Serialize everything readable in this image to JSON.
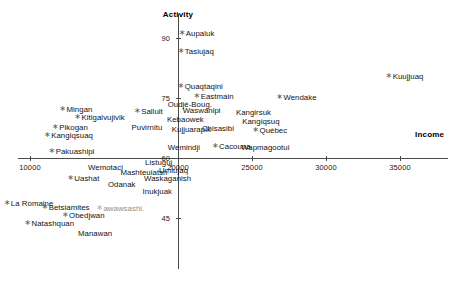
{
  "chart_data": {
    "type": "scatter",
    "title": "",
    "xlabel": "Income",
    "ylabel": "Activity",
    "xlim": [
      8200,
      36800
    ],
    "ylim": [
      40,
      93
    ],
    "xticks": [
      10000,
      20000,
      25000,
      30000,
      35000
    ],
    "yticks": [
      90,
      75,
      60,
      45
    ],
    "grid": false,
    "legend": null,
    "marker": "asterisk",
    "axes_style": "crossed-at-origin",
    "points": [
      {
        "label": "Aupaluk",
        "x": 21250,
        "y": 91.0
      },
      {
        "label": "Tasiujaq",
        "x": 21200,
        "y": 86.5
      },
      {
        "label": "Kuujjuaq",
        "x": 35300,
        "y": 80.2
      },
      {
        "label": "Quaqtaqini",
        "x": 21500,
        "y": 77.8
      },
      {
        "label": "Eastmain",
        "x": 22400,
        "y": 75.2
      },
      {
        "label": "Wendake",
        "x": 28000,
        "y": 74.9
      },
      {
        "label": "Oudjé-Boug.",
        "x": 20800,
        "y": 73.2,
        "nomarker": true
      },
      {
        "label": "Mingan",
        "x": 13100,
        "y": 72.0
      },
      {
        "label": "Waswanipi",
        "x": 21600,
        "y": 71.7,
        "nomarker": true
      },
      {
        "label": "Salluit",
        "x": 18000,
        "y": 71.5
      },
      {
        "label": "Kangirsuk",
        "x": 25100,
        "y": 71.3,
        "nomarker": true
      },
      {
        "label": "Kitigalvujivik",
        "x": 14700,
        "y": 69.9
      },
      {
        "label": "Kebaowek",
        "x": 20500,
        "y": 69.4,
        "nomarker": true
      },
      {
        "label": "Kangiqsuq",
        "x": 25600,
        "y": 68.9,
        "nomarker": true
      },
      {
        "label": "Pikogan",
        "x": 12700,
        "y": 67.6
      },
      {
        "label": "Puvirnitu",
        "x": 17900,
        "y": 67.5,
        "nomarker": true
      },
      {
        "label": "Kujjuarapik",
        "x": 20900,
        "y": 67.1,
        "nomarker": true
      },
      {
        "label": "Chisasibi",
        "x": 22700,
        "y": 67.2,
        "nomarker": true
      },
      {
        "label": "Québec",
        "x": 26200,
        "y": 66.8
      },
      {
        "label": "Kangiqsuaq",
        "x": 12600,
        "y": 65.6
      },
      {
        "label": "Wemindji",
        "x": 20400,
        "y": 62.6,
        "nomarker": true
      },
      {
        "label": "Cacouna",
        "x": 23600,
        "y": 62.7
      },
      {
        "label": "Wapmagootui",
        "x": 25900,
        "y": 62.6,
        "nomarker": true
      },
      {
        "label": "Pakuashipi",
        "x": 12800,
        "y": 61.6
      },
      {
        "label": "Listuguj",
        "x": 18700,
        "y": 58.7,
        "nomarker": true
      },
      {
        "label": "Wemotaci",
        "x": 15100,
        "y": 57.6,
        "nomarker": true
      },
      {
        "label": "Mashteuiatsh",
        "x": 17700,
        "y": 56.3,
        "nomarker": true
      },
      {
        "label": "Umiujaq",
        "x": 19700,
        "y": 56.7,
        "nomarker": true
      },
      {
        "label": "Uashat",
        "x": 13600,
        "y": 54.8
      },
      {
        "label": "Waskaganish",
        "x": 19300,
        "y": 54.7,
        "nomarker": true
      },
      {
        "label": "Odanak",
        "x": 16200,
        "y": 53.3,
        "nomarker": true
      },
      {
        "label": "Inukjuak",
        "x": 18600,
        "y": 51.4,
        "nomarker": true
      },
      {
        "label": "La Romaine",
        "x": 9900,
        "y": 48.6
      },
      {
        "label": "Betsiamites",
        "x": 12400,
        "y": 47.5
      },
      {
        "label": "awawsashi.",
        "x": 16100,
        "y": 47.3,
        "faint": true
      },
      {
        "label": "Obedjwan",
        "x": 13600,
        "y": 45.6
      },
      {
        "label": "Natashquan",
        "x": 11300,
        "y": 43.6
      },
      {
        "label": "Manawan",
        "x": 14400,
        "y": 41.0,
        "nomarker": true
      }
    ]
  },
  "axes": {
    "x_title": "Income",
    "y_title": "Activity"
  }
}
